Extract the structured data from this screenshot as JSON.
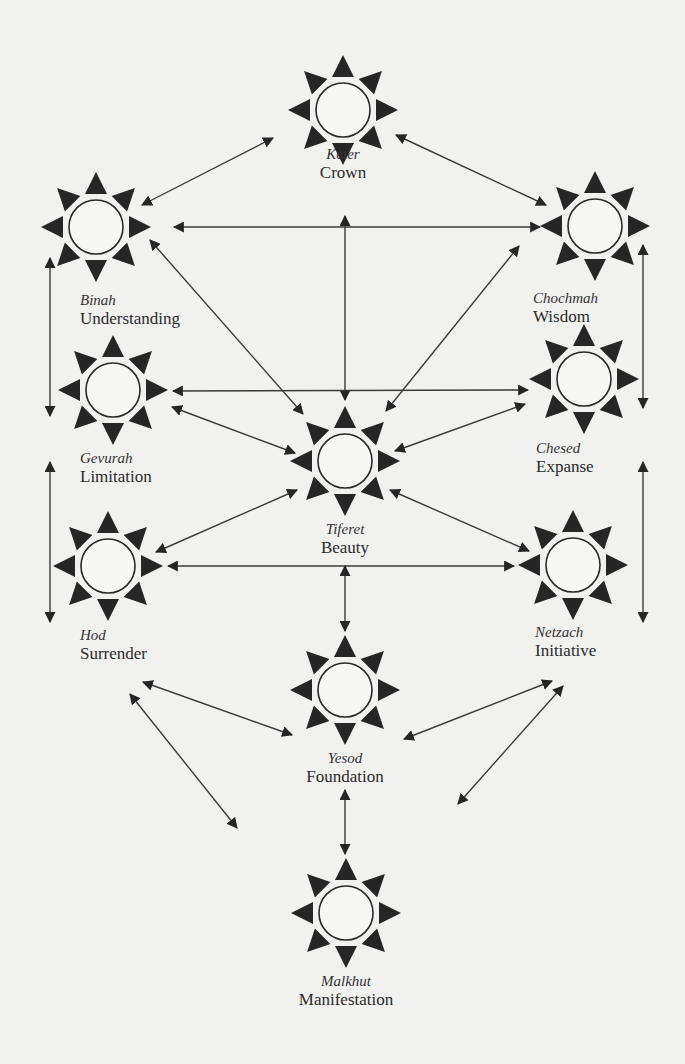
{
  "diagram": {
    "colors": {
      "background": "#f1f1f0",
      "ink": "#2a2a2a",
      "ray": "#262626",
      "line": "#3a3a3a"
    },
    "sefirot": [
      {
        "id": "keter",
        "hebrew": "Keter",
        "english": "Crown",
        "cx": 343,
        "cy": 110,
        "label_x": 343,
        "label_y": 146,
        "align": "center"
      },
      {
        "id": "binah",
        "hebrew": "Binah",
        "english": "Understanding",
        "cx": 96,
        "cy": 227,
        "label_x": 80,
        "label_y": 292,
        "align": "left"
      },
      {
        "id": "chochmah",
        "hebrew": "Chochmah",
        "english": "Wisdom",
        "cx": 595,
        "cy": 226,
        "label_x": 533,
        "label_y": 290,
        "align": "left"
      },
      {
        "id": "gevurah",
        "hebrew": "Gevurah",
        "english": "Limitation",
        "cx": 113,
        "cy": 390,
        "label_x": 80,
        "label_y": 450,
        "align": "left"
      },
      {
        "id": "chesed",
        "hebrew": "Chesed",
        "english": "Expanse",
        "cx": 584,
        "cy": 379,
        "label_x": 536,
        "label_y": 440,
        "align": "left"
      },
      {
        "id": "tiferet",
        "hebrew": "Tiferet",
        "english": "Beauty",
        "cx": 345,
        "cy": 461,
        "label_x": 345,
        "label_y": 521,
        "align": "center"
      },
      {
        "id": "hod",
        "hebrew": "Hod",
        "english": "Surrender",
        "cx": 108,
        "cy": 566,
        "label_x": 80,
        "label_y": 627,
        "align": "left"
      },
      {
        "id": "netzach",
        "hebrew": "Netzach",
        "english": "Initiative",
        "cx": 573,
        "cy": 565,
        "label_x": 535,
        "label_y": 624,
        "align": "left"
      },
      {
        "id": "yesod",
        "hebrew": "Yesod",
        "english": "Foundation",
        "cx": 345,
        "cy": 690,
        "label_x": 345,
        "label_y": 750,
        "align": "center"
      },
      {
        "id": "malkhut",
        "hebrew": "Malkhut",
        "english": "Manifestation",
        "cx": 346,
        "cy": 913,
        "label_x": 346,
        "label_y": 973,
        "align": "center"
      }
    ],
    "paths": [
      {
        "from": "keter",
        "to": "binah",
        "x1": 273,
        "y1": 138,
        "x2": 142,
        "y2": 205
      },
      {
        "from": "keter",
        "to": "chochmah",
        "x1": 396,
        "y1": 135,
        "x2": 546,
        "y2": 205
      },
      {
        "from": "binah",
        "to": "chochmah",
        "x1": 174,
        "y1": 227,
        "x2": 540,
        "y2": 227
      },
      {
        "from": "keter",
        "to": "tiferet",
        "x1": 345,
        "y1": 216,
        "x2": 345,
        "y2": 400
      },
      {
        "from": "binah",
        "to": "tiferet",
        "x1": 150,
        "y1": 240,
        "x2": 303,
        "y2": 414
      },
      {
        "from": "chochmah",
        "to": "tiferet",
        "x1": 519,
        "y1": 246,
        "x2": 386,
        "y2": 411
      },
      {
        "from": "binah",
        "to": "gevurah",
        "x1": 50,
        "y1": 258,
        "x2": 50,
        "y2": 416
      },
      {
        "from": "chochmah",
        "to": "chesed",
        "x1": 643,
        "y1": 245,
        "x2": 643,
        "y2": 408
      },
      {
        "from": "gevurah",
        "to": "chesed",
        "x1": 173,
        "y1": 391,
        "x2": 528,
        "y2": 390
      },
      {
        "from": "gevurah",
        "to": "tiferet",
        "x1": 172,
        "y1": 407,
        "x2": 295,
        "y2": 453
      },
      {
        "from": "chesed",
        "to": "tiferet",
        "x1": 525,
        "y1": 404,
        "x2": 395,
        "y2": 451
      },
      {
        "from": "gevurah",
        "to": "hod",
        "x1": 50,
        "y1": 462,
        "x2": 50,
        "y2": 622
      },
      {
        "from": "chesed",
        "to": "netzach",
        "x1": 643,
        "y1": 462,
        "x2": 643,
        "y2": 622
      },
      {
        "from": "tiferet",
        "to": "hod",
        "x1": 297,
        "y1": 490,
        "x2": 156,
        "y2": 552
      },
      {
        "from": "tiferet",
        "to": "netzach",
        "x1": 390,
        "y1": 490,
        "x2": 529,
        "y2": 551
      },
      {
        "from": "hod",
        "to": "netzach",
        "x1": 168,
        "y1": 566,
        "x2": 514,
        "y2": 566
      },
      {
        "from": "tiferet",
        "to": "yesod",
        "x1": 345,
        "y1": 566,
        "x2": 345,
        "y2": 631
      },
      {
        "from": "hod",
        "to": "yesod",
        "x1": 143,
        "y1": 682,
        "x2": 292,
        "y2": 735
      },
      {
        "from": "netzach",
        "to": "yesod",
        "x1": 552,
        "y1": 681,
        "x2": 404,
        "y2": 739
      },
      {
        "from": "hod",
        "to": "malkhut",
        "x1": 130,
        "y1": 694,
        "x2": 237,
        "y2": 828
      },
      {
        "from": "netzach",
        "to": "malkhut",
        "x1": 563,
        "y1": 686,
        "x2": 458,
        "y2": 804
      },
      {
        "from": "yesod",
        "to": "malkhut",
        "x1": 345,
        "y1": 790,
        "x2": 345,
        "y2": 854
      }
    ]
  }
}
